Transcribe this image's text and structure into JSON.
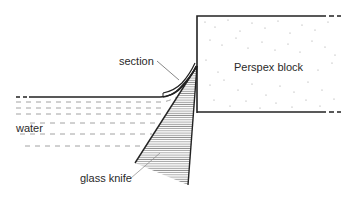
{
  "diagram": {
    "labels": {
      "section": "section",
      "perspex_block": "Perspex block",
      "water": "water",
      "glass_knife": "glass knife"
    },
    "colors": {
      "line": "#222222",
      "hatch": "#555555",
      "water_dash": "#8a8a8a",
      "dots": "#9a9a9a",
      "background": "#ffffff"
    }
  }
}
